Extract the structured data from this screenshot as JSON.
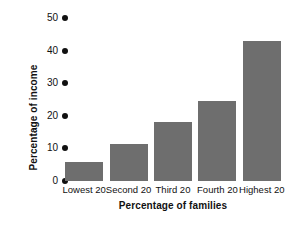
{
  "chart_data": {
    "type": "bar",
    "title": "",
    "categories": [
      "Lowest 20",
      "Second 20",
      "Third 20",
      "Fourth 20",
      "Highest 20"
    ],
    "values": [
      5.7,
      11.3,
      18.0,
      24.5,
      43.0
    ],
    "xlabel": "Percentage of families",
    "ylabel": "Percentage of income",
    "ylim": [
      0,
      50
    ],
    "yticks": [
      0,
      10,
      20,
      30,
      40,
      50
    ],
    "ytick_labels": [
      "0",
      "10",
      "20",
      "30",
      "40",
      "50"
    ],
    "grid": false,
    "legend": false,
    "bar_color": "#6e6e6e",
    "tick_marker": "filled-circle",
    "background_color": "#ffffff",
    "text_color": "#111111"
  }
}
